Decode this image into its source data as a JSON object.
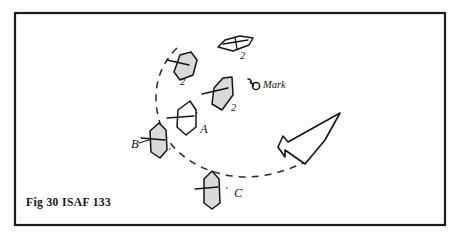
{
  "figure": {
    "caption": "Fig 30  ISAF 133",
    "frame": {
      "x": 15,
      "y": 13,
      "width": 430,
      "height": 212
    },
    "background_color": "#fdfdfd",
    "ink_color": "#141414",
    "hull_fill_color": "#dadada"
  },
  "mark": {
    "label": "Mark",
    "icon": "buoy-icon",
    "x": 263,
    "y": 88
  },
  "wind_arrow": {
    "icon": "wind-direction-arrow",
    "points": "340,113 288,142 283,136 278,147 285,157 285,150 305,164 325,140",
    "direction": "up-left"
  },
  "zone_arc": {
    "label": "",
    "path": "M 177,48 C 152,72 152,106 163,131 C 176,159 210,176 244,177 C 268,177 290,170 309,160",
    "style": "dashed"
  },
  "boats": [
    {
      "id": "boat-top-2",
      "label": "2",
      "letter": "",
      "fill": "open",
      "label_x": 240,
      "label_y": 59,
      "hull": "M 218,47 L 225,40 L 240,36 L 253,38 L 249,45 L 233,51 Z",
      "rigging": "M 223,44 L 248,40 M 235,37 L 237,49"
    },
    {
      "id": "boat-left-2",
      "label": "2",
      "letter": "",
      "fill": "shaded",
      "label_x": 180,
      "label_y": 85,
      "hull": "M 180,55 L 191,52 L 197,60 L 193,75 L 180,80 L 174,72 Z",
      "rigging": "M 167,60 L 189,65"
    },
    {
      "id": "boat-mid-2",
      "label": "2",
      "letter": "",
      "fill": "shaded",
      "label_x": 231,
      "label_y": 111,
      "hull": "M 223,78 L 232,77 L 233,95 L 222,110 L 212,104 L 214,88 Z",
      "rigging": "M 202,94 L 228,88"
    },
    {
      "id": "boat-a",
      "label": "A",
      "letter": "A",
      "fill": "open",
      "label_x": 200,
      "label_y": 133,
      "tick": "'",
      "tick_x": 195,
      "tick_y": 119,
      "hull": "M 190,101 L 196,110 L 196,127 L 186,135 L 177,127 L 178,110 Z",
      "rigging": "M 167,118 L 194,116"
    },
    {
      "id": "boat-b",
      "label": "B",
      "letter": "B",
      "fill": "shaded",
      "label_x": 131,
      "label_y": 148,
      "tick": "'",
      "tick_x": 168,
      "tick_y": 155,
      "hull": "M 159,123 L 166,130 L 167,150 L 160,158 L 151,152 L 150,131 Z",
      "rigging": "M 141,138 L 165,140",
      "leader": "M 139,143 L 158,137"
    },
    {
      "id": "boat-c",
      "label": "C",
      "letter": "C",
      "fill": "shaded",
      "label_x": 234,
      "label_y": 197,
      "tick": "'",
      "tick_x": 225,
      "tick_y": 194,
      "hull": "M 212,171 L 219,179 L 220,203 L 212,209 L 204,203 L 204,179 Z",
      "rigging": "M 195,189 L 218,187"
    }
  ]
}
